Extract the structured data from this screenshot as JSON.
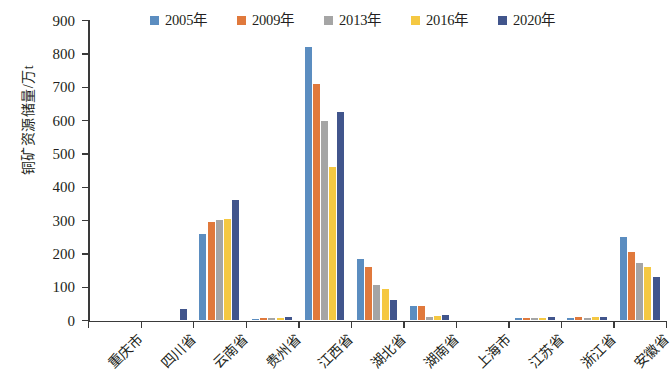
{
  "chart_data": {
    "type": "bar",
    "title": "",
    "xlabel": "",
    "ylabel": "铜矿资源储量/万t",
    "ylim": [
      0,
      900
    ],
    "ytick_step": 100,
    "yticks": [
      "900",
      "800",
      "700",
      "600",
      "500",
      "400",
      "300",
      "200",
      "100",
      "0"
    ],
    "grid": false,
    "legend_position": "top",
    "categories": [
      "重庆市",
      "四川省",
      "云南省",
      "贵州省",
      "江西省",
      "湖北省",
      "湖南省",
      "上海市",
      "江苏省",
      "浙江省",
      "安徽省"
    ],
    "series": [
      {
        "name": "2005年",
        "color": "#5B8DC0",
        "values": [
          0,
          0,
          260,
          5,
          820,
          185,
          42,
          0,
          8,
          6,
          250
        ]
      },
      {
        "name": "2009年",
        "color": "#E0793C",
        "values": [
          0,
          0,
          295,
          8,
          710,
          160,
          42,
          0,
          6,
          10,
          205
        ]
      },
      {
        "name": "2013年",
        "color": "#A5A5A5",
        "values": [
          0,
          0,
          300,
          7,
          598,
          105,
          10,
          0,
          6,
          8,
          172
        ]
      },
      {
        "name": "2016年",
        "color": "#F5C842",
        "values": [
          0,
          0,
          303,
          7,
          460,
          95,
          12,
          0,
          7,
          9,
          160
        ]
      },
      {
        "name": "2020年",
        "color": "#41558C",
        "values": [
          0,
          33,
          360,
          9,
          625,
          60,
          15,
          0,
          9,
          10,
          130
        ]
      }
    ]
  }
}
